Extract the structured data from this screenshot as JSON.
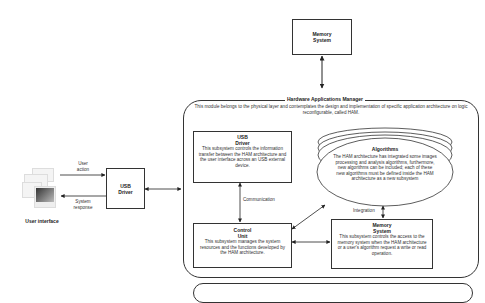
{
  "diagram": {
    "memory_top": {
      "line1": "Memory",
      "line2": "System"
    },
    "ham": {
      "title": "Hardware Applications Manager",
      "description": "This module belongs to the physical layer and contemplates the design and implementation of specific application architecture on logic reconfigurable, called HAM."
    },
    "user_interface": {
      "label": "User interface"
    },
    "usb_driver_outer": {
      "line1": "USB",
      "line2": "Driver"
    },
    "edges": {
      "user_action": {
        "line1": "User",
        "line2": "action"
      },
      "system_response": {
        "line1": "System",
        "line2": "response"
      },
      "communication": "Communication",
      "integration": "Integration"
    },
    "usb_driver_inner": {
      "line1": "USB",
      "line2": "Driver",
      "description": "This subsystem controls the information transfer between the HAM architecture and the user interface across an USB external device."
    },
    "control_unit": {
      "line1": "Control",
      "line2": "Unit",
      "description": "This subsystem manages the system resources and the functions developed by the HAM architecture."
    },
    "algorithms": {
      "title": "Algorithms",
      "description": "The HAM architecture has integrated some images processing and analysis algorithms, furthermore, new algorithms can be included; each of these new algorithms must be defined inside the HAM architecture as a new subsystem"
    },
    "memory_inner": {
      "line1": "Memory",
      "line2": "System",
      "description": "This subsystem controls the access to the memory system when the HAM architecture or a user's algorithm request a write or read operation."
    }
  }
}
